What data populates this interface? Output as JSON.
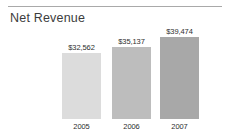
{
  "chart_data": {
    "type": "bar",
    "title": "Net Revenue",
    "xlabel": "",
    "ylabel": "",
    "categories": [
      "2005",
      "2006",
      "2007"
    ],
    "values": [
      32562,
      35137,
      39474
    ],
    "value_labels": [
      "$32,562",
      "$35,137",
      "$39,474"
    ],
    "series": [
      {
        "name": "Net Revenue",
        "values": [
          32562,
          35137,
          39474
        ]
      }
    ],
    "bar_colors": [
      "#dcdcdc",
      "#bdbdbd",
      "#a8a8a8"
    ],
    "grid": false,
    "legend": false,
    "ylim": [
      0,
      45000
    ],
    "axis_line_color": "#a9a9a9"
  }
}
